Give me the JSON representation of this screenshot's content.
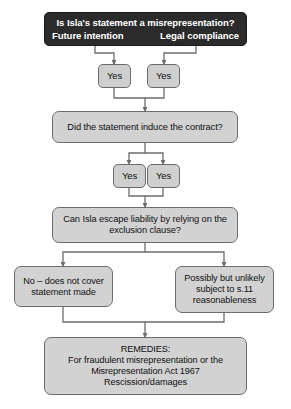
{
  "diagram": {
    "colors": {
      "header_fill": "#2b2b2b",
      "header_text": "#ffffff",
      "node_fill": "#d2d2d2",
      "node_border": "#6d6d6d",
      "node_text": "#111111",
      "connector": "#6d6d6d",
      "background": "#ffffff"
    },
    "nodes": {
      "header": {
        "question": "Is Isla's statement a misrepresentation?",
        "branch_left": "Future intention",
        "branch_right": "Legal compliance"
      },
      "yes_1_left": "Yes",
      "yes_1_right": "Yes",
      "inducement": "Did the statement induce the contract?",
      "yes_2_left": "Yes",
      "yes_2_right": "Yes",
      "exclusion": {
        "line1": "Can Isla escape liability by relying on the",
        "line2": "exclusion clause?"
      },
      "outcome_no": {
        "line1": "No – does not cover",
        "line2": "statement made"
      },
      "outcome_possibly": {
        "line1": "Possibly but unlikely",
        "line2": "subject to s.11",
        "line3": "reasonableness"
      },
      "remedies": {
        "line1": "REMEDIES:",
        "line2": "For fraudulent misrepresentation or the",
        "line3": "Misrepresentation Act 1967",
        "line4": "Rescission/damages"
      }
    }
  }
}
